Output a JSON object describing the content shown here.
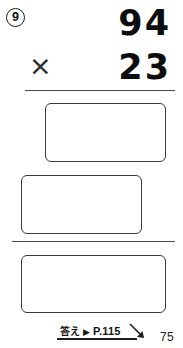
{
  "worksheet": {
    "problem_number": "9",
    "problem": {
      "multiplicand": "94",
      "multiplier": "23",
      "operator": "×"
    },
    "answer_boxes": [
      {
        "name": "partial-product-first",
        "value": ""
      },
      {
        "name": "partial-product-second",
        "value": ""
      },
      {
        "name": "final-product",
        "value": ""
      }
    ],
    "footer": {
      "answer_label": "答え",
      "triangle": "▶",
      "page_reference": "P.115"
    },
    "page_number": "75"
  },
  "colors": {
    "ink": "#0d0d0d",
    "rule": "#4a4a4a",
    "box_border": "#3b3b3b",
    "background": "#ffffff"
  }
}
